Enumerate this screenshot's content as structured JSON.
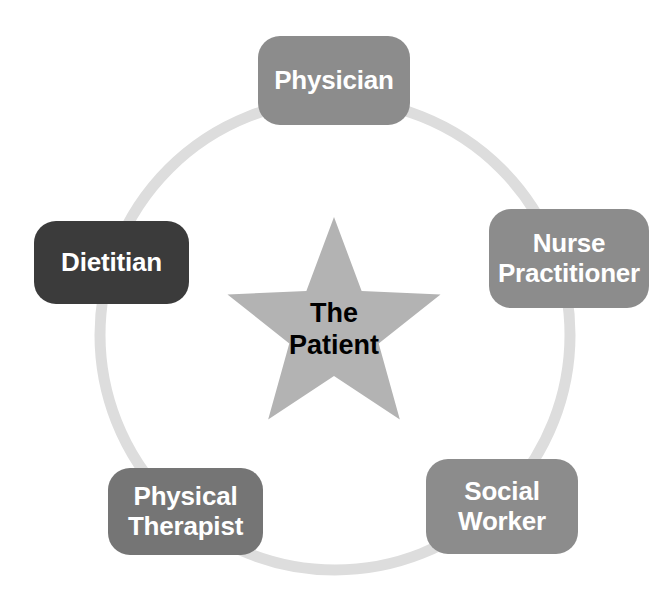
{
  "diagram": {
    "background_color": "#ffffff",
    "ring": {
      "name": "care-team-ring",
      "color": "#dddddd",
      "center_x": 335,
      "center_y": 335,
      "radius": 235,
      "stroke_width": 11
    },
    "center": {
      "shape": "star",
      "label": "The\nPatient",
      "fill_color": "#b3b3b3",
      "text_color": "#000000",
      "center_x": 334,
      "center_y": 329,
      "outer_radius": 112,
      "inner_radius": 47,
      "label_x": 252,
      "label_y": 298,
      "label_width": 164
    },
    "nodes": [
      {
        "id": "physician",
        "label": "Physician",
        "color": "#8c8c8c",
        "text_color": "#ffffff",
        "x": 258,
        "y": 36,
        "width": 152,
        "height": 89,
        "font_size": 26
      },
      {
        "id": "nurse-practitioner",
        "label": "Nurse\nPractitioner",
        "color": "#8c8c8c",
        "text_color": "#ffffff",
        "x": 489,
        "y": 209,
        "width": 160,
        "height": 99,
        "font_size": 26
      },
      {
        "id": "social-worker",
        "label": "Social\nWorker",
        "color": "#8c8c8c",
        "text_color": "#ffffff",
        "x": 426,
        "y": 459,
        "width": 152,
        "height": 95,
        "font_size": 26
      },
      {
        "id": "physical-therapist",
        "label": "Physical\nTherapist",
        "color": "#757575",
        "text_color": "#ffffff",
        "x": 108,
        "y": 468,
        "width": 155,
        "height": 87,
        "font_size": 26
      },
      {
        "id": "dietitian",
        "label": "Dietitian",
        "color": "#3b3b3b",
        "text_color": "#ffffff",
        "x": 34,
        "y": 221,
        "width": 155,
        "height": 83,
        "font_size": 26
      }
    ]
  }
}
